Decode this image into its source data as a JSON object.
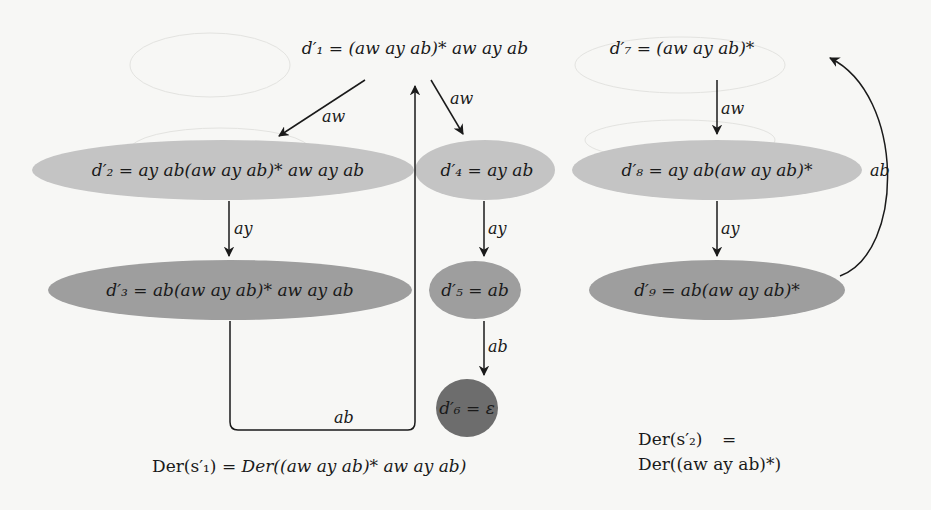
{
  "diagram": {
    "colors": {
      "background": "#f7f7f5",
      "level1_fill": "#c4c4c4",
      "level2_fill": "#9e9e9e",
      "level3_fill": "#6d6d6d",
      "edge": "#1a1a1a"
    },
    "nodes": [
      {
        "id": "d1",
        "name": "d'_1",
        "label_lhs": "d′₁",
        "label_rhs": "= (aw ay ab)* aw ay ab",
        "shaded": false
      },
      {
        "id": "d2",
        "name": "d'_2",
        "label_lhs": "d′₂",
        "label_rhs": "= ay ab(aw ay ab)* aw ay ab",
        "shaded": "light"
      },
      {
        "id": "d3",
        "name": "d'_3",
        "label_lhs": "d′₃",
        "label_rhs": "= ab(aw ay ab)* aw ay ab",
        "shaded": "medium"
      },
      {
        "id": "d4",
        "name": "d'_4",
        "label_lhs": "d′₄",
        "label_rhs": "= ay ab",
        "shaded": "light"
      },
      {
        "id": "d5",
        "name": "d'_5",
        "label_lhs": "d′₅",
        "label_rhs": "= ab",
        "shaded": "medium"
      },
      {
        "id": "d6",
        "name": "d'_6",
        "label_lhs": "d′₆",
        "label_rhs": "= ε",
        "shaded": "dark"
      },
      {
        "id": "d7",
        "name": "d'_7",
        "label_lhs": "d′₇",
        "label_rhs": "= (aw ay ab)*",
        "shaded": false
      },
      {
        "id": "d8",
        "name": "d'_8",
        "label_lhs": "d′₈",
        "label_rhs": "= ay ab(aw ay ab)*",
        "shaded": "light"
      },
      {
        "id": "d9",
        "name": "d'_9",
        "label_lhs": "d′₉",
        "label_rhs": "= ab(aw ay ab)*",
        "shaded": "medium"
      }
    ],
    "edges": [
      {
        "from": "d1",
        "to": "d2",
        "label": "aw"
      },
      {
        "from": "d1",
        "to": "d4",
        "label": "aw"
      },
      {
        "from": "d2",
        "to": "d3",
        "label": "ay"
      },
      {
        "from": "d3",
        "to": "d1",
        "label": "ab"
      },
      {
        "from": "d4",
        "to": "d5",
        "label": "ay"
      },
      {
        "from": "d5",
        "to": "d6",
        "label": "ab"
      },
      {
        "from": "d7",
        "to": "d8",
        "label": "aw"
      },
      {
        "from": "d8",
        "to": "d9",
        "label": "ay"
      },
      {
        "from": "d9",
        "to": "d7",
        "label": "ab"
      }
    ],
    "captions": {
      "left": {
        "lhs": "Der(s′₁)",
        "eq": "=",
        "rhs": "Der((aw ay ab)* aw ay ab)"
      },
      "right": {
        "line1_lhs": "Der(s′₂)",
        "line1_eq": "=",
        "line2": "Der((aw ay ab)*)"
      }
    }
  }
}
